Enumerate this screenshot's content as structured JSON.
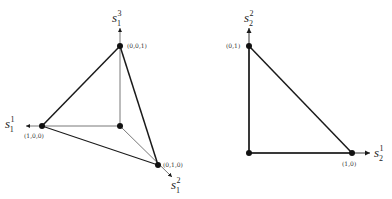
{
  "left_diagram": {
    "axes": {
      "x1": {
        "base": "s",
        "sub": "1",
        "sup": "1"
      },
      "x2": {
        "base": "s",
        "sub": "1",
        "sup": "2"
      },
      "x3": {
        "base": "s",
        "sub": "1",
        "sup": "3"
      }
    },
    "vertices": {
      "top": "(0,0,1)",
      "left": "(1,0,0)",
      "bottom_right": "(0,1,0)"
    }
  },
  "right_diagram": {
    "axes": {
      "x1": {
        "base": "s",
        "sub": "2",
        "sup": "1"
      },
      "x2": {
        "base": "s",
        "sub": "2",
        "sup": "2"
      }
    },
    "vertices": {
      "top": "(0,1)",
      "right": "(1,0)"
    }
  },
  "colors": {
    "line": "#1a1a1a",
    "thin_line": "#555555"
  }
}
